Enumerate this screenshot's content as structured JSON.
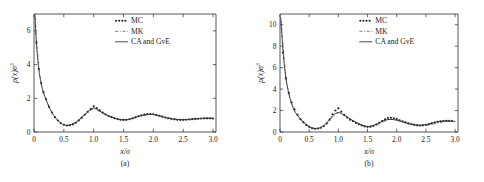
{
  "figure": {
    "background": "#ffffff",
    "ink_color": "#2b2b2b"
  },
  "chart_data": [
    {
      "type": "line",
      "panel_id": "a",
      "caption": "(a)",
      "title": "",
      "xlabel": "x/σ",
      "ylabel": "ρ(x)σ³",
      "xlim": [
        0,
        3.05
      ],
      "ylim": [
        0,
        7
      ],
      "grid": false,
      "xticks": [
        0,
        0.5,
        1.0,
        1.5,
        2.0,
        2.5,
        3.0
      ],
      "xticklabels": [
        "0",
        "0.5",
        "1.0",
        "1.5",
        "2.0",
        "2.5",
        "3.0"
      ],
      "yticks": [
        0,
        2,
        4,
        6
      ],
      "yticklabels": [
        "0",
        "2",
        "4",
        "6"
      ],
      "legend_position": "top-center",
      "legend": [
        "MC",
        "MK",
        "CA  and GvE"
      ],
      "series": [
        {
          "name": "MC",
          "style": "markers",
          "marker": "dot",
          "x": [
            0.04,
            0.08,
            0.12,
            0.16,
            0.2,
            0.25,
            0.3,
            0.35,
            0.4,
            0.45,
            0.5,
            0.55,
            0.6,
            0.65,
            0.7,
            0.75,
            0.8,
            0.85,
            0.9,
            0.95,
            1.0,
            1.05,
            1.1,
            1.15,
            1.2,
            1.25,
            1.3,
            1.35,
            1.4,
            1.45,
            1.5,
            1.55,
            1.6,
            1.65,
            1.7,
            1.75,
            1.8,
            1.85,
            1.9,
            1.95,
            2.0,
            2.05,
            2.1,
            2.15,
            2.2,
            2.25,
            2.3,
            2.35,
            2.4,
            2.45,
            2.5,
            2.55,
            2.6,
            2.65,
            2.7,
            2.75,
            2.8,
            2.85,
            2.9,
            2.95,
            3.0
          ],
          "y": [
            5.3,
            3.75,
            2.9,
            2.35,
            1.95,
            1.5,
            1.15,
            0.88,
            0.68,
            0.52,
            0.43,
            0.39,
            0.4,
            0.45,
            0.55,
            0.68,
            0.85,
            1.02,
            1.2,
            1.38,
            1.52,
            1.42,
            1.28,
            1.15,
            1.04,
            0.95,
            0.88,
            0.82,
            0.77,
            0.73,
            0.72,
            0.73,
            0.76,
            0.81,
            0.87,
            0.93,
            0.99,
            1.03,
            1.06,
            1.07,
            1.05,
            1.01,
            0.96,
            0.91,
            0.86,
            0.82,
            0.78,
            0.75,
            0.73,
            0.72,
            0.72,
            0.73,
            0.74,
            0.76,
            0.78,
            0.79,
            0.8,
            0.81,
            0.81,
            0.81,
            0.8
          ]
        },
        {
          "name": "MK",
          "style": "dash-dot",
          "x": [
            0.02,
            0.05,
            0.1,
            0.15,
            0.2,
            0.3,
            0.4,
            0.5,
            0.6,
            0.7,
            0.8,
            0.9,
            0.95,
            1.0,
            1.05,
            1.1,
            1.2,
            1.3,
            1.4,
            1.5,
            1.6,
            1.7,
            1.8,
            1.9,
            2.0,
            2.1,
            2.2,
            2.3,
            2.4,
            2.5,
            2.6,
            2.7,
            2.8,
            2.9,
            3.0
          ],
          "y": [
            6.8,
            5.15,
            3.35,
            2.45,
            1.95,
            1.16,
            0.7,
            0.42,
            0.41,
            0.56,
            0.84,
            1.15,
            1.28,
            1.36,
            1.3,
            1.22,
            1.05,
            0.88,
            0.76,
            0.71,
            0.75,
            0.85,
            0.96,
            1.03,
            1.04,
            0.97,
            0.88,
            0.8,
            0.75,
            0.73,
            0.74,
            0.77,
            0.8,
            0.82,
            0.83
          ]
        },
        {
          "name": "CA  and GvE",
          "style": "solid",
          "x": [
            0.015,
            0.04,
            0.08,
            0.12,
            0.16,
            0.2,
            0.25,
            0.3,
            0.35,
            0.4,
            0.45,
            0.5,
            0.55,
            0.6,
            0.65,
            0.7,
            0.75,
            0.8,
            0.85,
            0.9,
            0.95,
            1.0,
            1.05,
            1.1,
            1.15,
            1.2,
            1.25,
            1.3,
            1.35,
            1.4,
            1.45,
            1.5,
            1.55,
            1.6,
            1.65,
            1.7,
            1.75,
            1.8,
            1.85,
            1.9,
            1.95,
            2.0,
            2.05,
            2.1,
            2.15,
            2.2,
            2.25,
            2.3,
            2.35,
            2.4,
            2.45,
            2.5,
            2.55,
            2.6,
            2.65,
            2.7,
            2.75,
            2.8,
            2.85,
            2.9,
            2.95,
            3.0
          ],
          "y": [
            6.95,
            5.3,
            3.72,
            2.88,
            2.32,
            1.94,
            1.5,
            1.16,
            0.89,
            0.69,
            0.53,
            0.43,
            0.39,
            0.41,
            0.47,
            0.57,
            0.71,
            0.87,
            1.04,
            1.2,
            1.33,
            1.42,
            1.36,
            1.25,
            1.14,
            1.04,
            0.95,
            0.88,
            0.82,
            0.77,
            0.74,
            0.72,
            0.73,
            0.76,
            0.81,
            0.86,
            0.92,
            0.97,
            1.01,
            1.04,
            1.05,
            1.04,
            1.0,
            0.96,
            0.91,
            0.86,
            0.82,
            0.79,
            0.76,
            0.74,
            0.73,
            0.73,
            0.74,
            0.75,
            0.77,
            0.78,
            0.79,
            0.8,
            0.81,
            0.81,
            0.81,
            0.81
          ]
        }
      ]
    },
    {
      "type": "line",
      "panel_id": "b",
      "caption": "(b)",
      "title": "",
      "xlabel": "x/σ",
      "ylabel": "ρ(x)σ³",
      "xlim": [
        0,
        3.05
      ],
      "ylim": [
        0,
        11
      ],
      "grid": false,
      "xticks": [
        0,
        0.5,
        1.0,
        1.5,
        2.0,
        2.5,
        3.0
      ],
      "xticklabels": [
        "0",
        "0.5",
        "1.0",
        "1.5",
        "2.0",
        "2.5",
        "3.0"
      ],
      "yticks": [
        0,
        2,
        4,
        6,
        8,
        10
      ],
      "yticklabels": [
        "0",
        "2",
        "4",
        "6",
        "8",
        "10"
      ],
      "legend_position": "top-center",
      "legend": [
        "MC",
        "MK",
        "CA  and GvE"
      ],
      "series": [
        {
          "name": "MC",
          "style": "markers",
          "marker": "dot",
          "x": [
            0.05,
            0.1,
            0.15,
            0.2,
            0.25,
            0.3,
            0.35,
            0.4,
            0.45,
            0.5,
            0.55,
            0.6,
            0.65,
            0.7,
            0.75,
            0.8,
            0.85,
            0.9,
            0.95,
            1.0,
            1.05,
            1.1,
            1.15,
            1.2,
            1.25,
            1.3,
            1.35,
            1.4,
            1.45,
            1.5,
            1.55,
            1.6,
            1.65,
            1.7,
            1.75,
            1.8,
            1.85,
            1.9,
            1.95,
            2.0,
            2.05,
            2.1,
            2.15,
            2.2,
            2.25,
            2.3,
            2.35,
            2.4,
            2.45,
            2.5,
            2.55,
            2.6,
            2.65,
            2.7,
            2.75,
            2.8,
            2.85,
            2.9,
            2.95
          ],
          "y": [
            7.4,
            5.0,
            3.65,
            2.75,
            2.1,
            1.6,
            1.2,
            0.9,
            0.66,
            0.48,
            0.36,
            0.3,
            0.32,
            0.4,
            0.55,
            0.8,
            1.15,
            1.65,
            2.0,
            2.2,
            1.9,
            1.6,
            1.35,
            1.15,
            1.0,
            0.85,
            0.72,
            0.6,
            0.52,
            0.48,
            0.5,
            0.58,
            0.7,
            0.86,
            1.02,
            1.18,
            1.3,
            1.33,
            1.28,
            1.2,
            1.1,
            1.0,
            0.9,
            0.8,
            0.72,
            0.66,
            0.62,
            0.6,
            0.62,
            0.66,
            0.72,
            0.8,
            0.88,
            0.95,
            1.0,
            1.03,
            1.04,
            1.04,
            1.02
          ]
        },
        {
          "name": "MK",
          "style": "dash-dot",
          "x": [
            0.02,
            0.05,
            0.1,
            0.15,
            0.2,
            0.3,
            0.4,
            0.5,
            0.6,
            0.7,
            0.8,
            0.9,
            0.95,
            1.0,
            1.05,
            1.1,
            1.2,
            1.3,
            1.4,
            1.5,
            1.6,
            1.7,
            1.8,
            1.85,
            1.9,
            2.0,
            2.1,
            2.2,
            2.3,
            2.4,
            2.5,
            2.6,
            2.7,
            2.8,
            2.9,
            3.0
          ],
          "y": [
            10.4,
            8.3,
            5.25,
            3.7,
            2.8,
            1.62,
            0.92,
            0.5,
            0.33,
            0.42,
            0.76,
            1.38,
            1.65,
            1.78,
            1.68,
            1.52,
            1.2,
            0.92,
            0.66,
            0.5,
            0.54,
            0.75,
            1.02,
            1.13,
            1.18,
            1.14,
            1.0,
            0.84,
            0.7,
            0.62,
            0.62,
            0.7,
            0.82,
            0.93,
            1.0,
            1.0
          ]
        },
        {
          "name": "CA  and GvE",
          "style": "solid",
          "x": [
            0.012,
            0.03,
            0.06,
            0.1,
            0.14,
            0.18,
            0.22,
            0.26,
            0.3,
            0.35,
            0.4,
            0.45,
            0.5,
            0.55,
            0.6,
            0.65,
            0.7,
            0.75,
            0.8,
            0.85,
            0.9,
            0.95,
            1.0,
            1.05,
            1.1,
            1.15,
            1.2,
            1.25,
            1.3,
            1.35,
            1.4,
            1.45,
            1.5,
            1.55,
            1.6,
            1.65,
            1.7,
            1.75,
            1.8,
            1.85,
            1.9,
            1.95,
            2.0,
            2.05,
            2.1,
            2.15,
            2.2,
            2.25,
            2.3,
            2.35,
            2.4,
            2.45,
            2.5,
            2.55,
            2.6,
            2.65,
            2.7,
            2.75,
            2.8,
            2.85,
            2.9,
            2.95,
            3.0
          ],
          "y": [
            10.7,
            9.2,
            7.0,
            5.05,
            3.85,
            2.95,
            2.3,
            1.85,
            1.55,
            1.2,
            0.92,
            0.68,
            0.5,
            0.38,
            0.32,
            0.34,
            0.43,
            0.6,
            0.85,
            1.18,
            1.5,
            1.72,
            1.82,
            1.74,
            1.58,
            1.4,
            1.22,
            1.06,
            0.92,
            0.78,
            0.66,
            0.56,
            0.5,
            0.52,
            0.6,
            0.72,
            0.86,
            1.0,
            1.1,
            1.16,
            1.18,
            1.15,
            1.1,
            1.02,
            0.94,
            0.86,
            0.78,
            0.72,
            0.67,
            0.64,
            0.63,
            0.65,
            0.69,
            0.75,
            0.82,
            0.89,
            0.95,
            0.99,
            1.02,
            1.03,
            1.02,
            1.0,
            0.98
          ]
        }
      ]
    }
  ]
}
